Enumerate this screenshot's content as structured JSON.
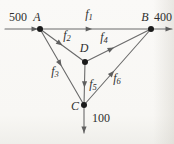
{
  "figure": {
    "kind": "network-flow-diagram",
    "inflow_left_value": "500",
    "outflow_right_value": "400",
    "outflow_bottom_value": "100",
    "node_ids": [
      "A",
      "B",
      "D",
      "C"
    ],
    "flow_labels": [
      "f1",
      "f2",
      "f3",
      "f4",
      "f5",
      "f6"
    ]
  },
  "diagram": {
    "canvas": {
      "width": 174,
      "height": 144
    },
    "colors": {
      "line": "#6a6a6a",
      "arrow": "#5f5f5f",
      "node": "#1b1b1b",
      "text": "#2e2e2e"
    },
    "node_radius": 3,
    "font_size": 12,
    "sub_font_size": 8.5,
    "nodes": [
      {
        "id": "A",
        "x": 40,
        "y": 29
      },
      {
        "id": "B",
        "x": 151,
        "y": 29
      },
      {
        "id": "D",
        "x": 85,
        "y": 62
      },
      {
        "id": "C",
        "x": 84,
        "y": 105
      }
    ],
    "labels": [
      {
        "name": "label-inflow-500",
        "text": "500",
        "x": 18,
        "y": 17,
        "italic": false
      },
      {
        "name": "label-node-a",
        "text": "A",
        "x": 37,
        "y": 17,
        "italic": true
      },
      {
        "name": "label-flow-f1",
        "text": "f",
        "sub": "1",
        "x": 89,
        "y": 14,
        "italic": true
      },
      {
        "name": "label-node-b",
        "text": "B",
        "x": 145,
        "y": 17,
        "italic": true
      },
      {
        "name": "label-outflow-400",
        "text": "400",
        "x": 163,
        "y": 17,
        "italic": false
      },
      {
        "name": "label-flow-f2",
        "text": "f",
        "sub": "2",
        "x": 67,
        "y": 35,
        "italic": true
      },
      {
        "name": "label-flow-f4",
        "text": "f",
        "sub": "4",
        "x": 104,
        "y": 37,
        "italic": true
      },
      {
        "name": "label-node-d",
        "text": "D",
        "x": 84,
        "y": 48,
        "italic": true
      },
      {
        "name": "label-flow-f3",
        "text": "f",
        "sub": "3",
        "x": 55,
        "y": 71,
        "italic": true
      },
      {
        "name": "label-flow-f5",
        "text": "f",
        "sub": "5",
        "x": 93,
        "y": 84,
        "italic": true
      },
      {
        "name": "label-flow-f6",
        "text": "f",
        "sub": "6",
        "x": 117,
        "y": 78,
        "italic": true
      },
      {
        "name": "label-node-c",
        "text": "C",
        "x": 75,
        "y": 106,
        "italic": true
      },
      {
        "name": "label-outflow-100",
        "text": "100",
        "x": 101,
        "y": 118,
        "italic": false
      }
    ],
    "edges": [
      {
        "name": "edge-inflow-left",
        "from": [
          5,
          29
        ],
        "to": [
          38,
          29
        ],
        "arrow": "end"
      },
      {
        "name": "edge-f1-a-to-b",
        "from": [
          40,
          29
        ],
        "to": [
          151,
          29
        ],
        "arrow": "mid",
        "t": 0.47
      },
      {
        "name": "edge-outflow-right",
        "from": [
          151,
          29
        ],
        "to": [
          172,
          29
        ],
        "arrow": "end"
      },
      {
        "name": "edge-f2-a-to-d",
        "from": [
          40,
          29
        ],
        "to": [
          85,
          62
        ],
        "arrow": "mid",
        "t": 0.5
      },
      {
        "name": "edge-f3-a-to-c",
        "from": [
          40,
          29
        ],
        "to": [
          84,
          105
        ],
        "arrow": "mid",
        "t": 0.49
      },
      {
        "name": "edge-f4-d-to-b",
        "from": [
          85,
          62
        ],
        "to": [
          151,
          29
        ],
        "arrow": "mid",
        "t": 0.44
      },
      {
        "name": "edge-f5-d-to-c",
        "from": [
          85,
          62
        ],
        "to": [
          84,
          105
        ],
        "arrow": "mid",
        "t": 0.6
      },
      {
        "name": "edge-f6-c-to-b",
        "from": [
          84,
          105
        ],
        "to": [
          151,
          29
        ],
        "arrow": "mid",
        "t": 0.45
      },
      {
        "name": "edge-outflow-bottom",
        "from": [
          84,
          105
        ],
        "to": [
          84,
          133
        ],
        "arrow": "end"
      }
    ]
  }
}
